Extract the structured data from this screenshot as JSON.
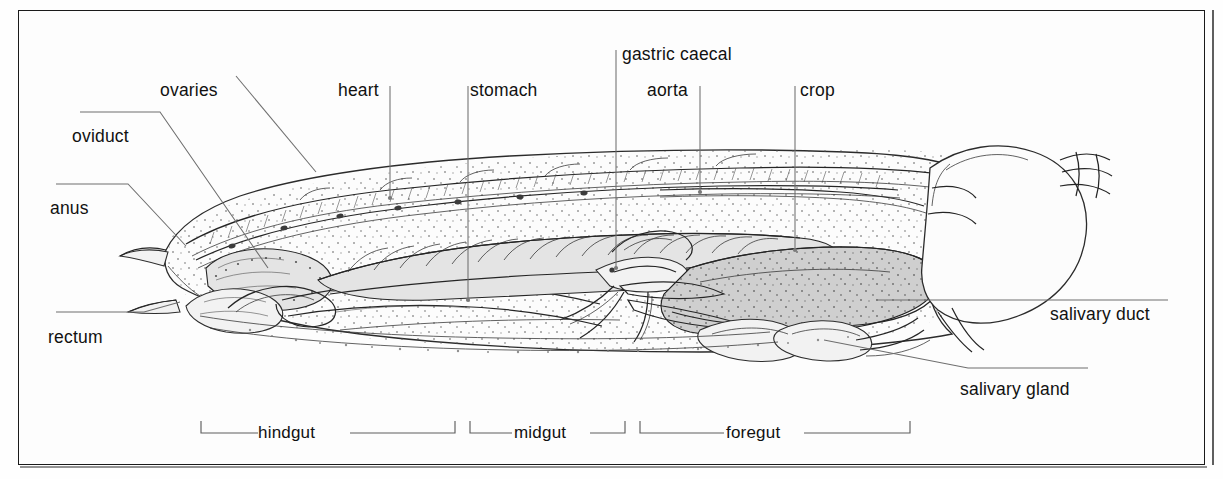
{
  "figure": {
    "kind": "anatomical-diagram",
    "frame_color": "#1a1a1a",
    "ink_color": "#2b2b2b",
    "leader_color": "#6e6e6e"
  },
  "labels": {
    "ovaries": "ovaries",
    "oviduct": "oviduct",
    "anus": "anus",
    "rectum": "rectum",
    "heart": "heart",
    "stomach": "stomach",
    "gastric_caecal": "gastric caecal",
    "aorta": "aorta",
    "crop": "crop",
    "salivary_duct": "salivary duct",
    "salivary_gland": "salivary gland"
  },
  "regions": {
    "hindgut": "hindgut",
    "midgut": "midgut",
    "foregut": "foregut"
  },
  "label_positions": {
    "ovaries": {
      "x": 160,
      "y": 80
    },
    "oviduct": {
      "x": 72,
      "y": 126
    },
    "anus": {
      "x": 50,
      "y": 198
    },
    "rectum": {
      "x": 48,
      "y": 327
    },
    "heart": {
      "x": 338,
      "y": 80
    },
    "stomach": {
      "x": 470,
      "y": 80
    },
    "gastric_caecal": {
      "x": 622,
      "y": 44
    },
    "aorta": {
      "x": 647,
      "y": 80
    },
    "crop": {
      "x": 800,
      "y": 80
    },
    "salivary_duct": {
      "x": 1050,
      "y": 304
    },
    "salivary_gland": {
      "x": 960,
      "y": 379
    },
    "hindgut": {
      "x": 281,
      "y": 421
    },
    "midgut": {
      "x": 536,
      "y": 421
    },
    "foregut": {
      "x": 748,
      "y": 421
    }
  },
  "brackets": [
    {
      "name": "hindgut",
      "x1": 201,
      "x2": 455,
      "y": 433,
      "tick": 12
    },
    {
      "name": "midgut",
      "x1": 470,
      "x2": 625,
      "y": 433,
      "tick": 12
    },
    {
      "name": "foregut",
      "x1": 640,
      "x2": 910,
      "y": 433,
      "tick": 12
    }
  ]
}
